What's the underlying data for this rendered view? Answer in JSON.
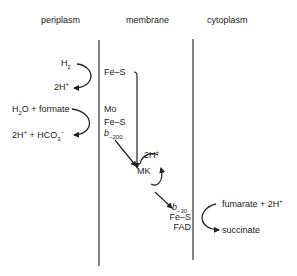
{
  "headers": {
    "periplasm": "periplasm",
    "membrane": "membrane",
    "cytoplasm": "cytoplasm"
  },
  "periplasm": {
    "reaction1": {
      "substrate": "H",
      "substrate_sub": "2",
      "product": "2H",
      "product_sup": "+"
    },
    "reaction2": {
      "substrate": "H",
      "substrate_sub": "2",
      "substrate_rest": "O + formate",
      "product": "2H",
      "product_sup": "+",
      "product_rest": " + HCO",
      "product_sub": "3",
      "product_sup2": "−"
    }
  },
  "membrane": {
    "hydrogenase": {
      "cofactor": "Fe–S"
    },
    "formate_dehydrogenase": {
      "mo": "Mo",
      "fes": "Fe–S",
      "cyt": "b",
      "cyt_sub": "−200"
    },
    "menaquinone": {
      "label": "MK",
      "protons": "2H",
      "protons_sup": "+"
    },
    "fumarate_reductase": {
      "cyt": "b",
      "cyt_sub": "−30",
      "fes": "Fe–S",
      "fad": "FAD"
    }
  },
  "cytoplasm": {
    "reaction": {
      "substrate": "fumarate + 2H",
      "substrate_sup": "+",
      "product": "succinate"
    }
  },
  "colors": {
    "line": "#222222",
    "background": "#ffffff"
  }
}
